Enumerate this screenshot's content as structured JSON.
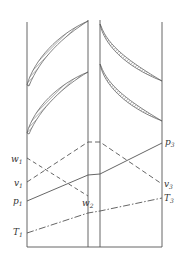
{
  "figure": {
    "colors": {
      "line": "#555555",
      "hatch": "#777777",
      "text": "#333333",
      "background": "#ffffff"
    },
    "cascades": {
      "nozzle": {
        "label": "stator blades",
        "count_visible": 2,
        "orientation": "curving up-right"
      },
      "rotor": {
        "label": "rotor blades",
        "count_visible": 2,
        "orientation": "curving down-right"
      }
    },
    "labels": {
      "w1": {
        "base": "w",
        "sub": "1"
      },
      "v1": {
        "base": "v",
        "sub": "1"
      },
      "p1": {
        "base": "p",
        "sub": "1"
      },
      "T1": {
        "base": "T",
        "sub": "1"
      },
      "w2": {
        "base": "w",
        "sub": "2"
      },
      "p3": {
        "base": "p",
        "sub": "3"
      },
      "v3": {
        "base": "v",
        "sub": "3"
      },
      "T3": {
        "base": "T",
        "sub": "3"
      }
    },
    "curves": [
      {
        "name": "v",
        "style": "dashed",
        "points": [
          [
            27,
            182
          ],
          [
            88,
            142
          ],
          [
            100,
            142
          ],
          [
            162,
            184
          ]
        ]
      },
      {
        "name": "w",
        "style": "dashed",
        "points": [
          [
            27,
            158
          ],
          [
            88,
            196
          ]
        ]
      },
      {
        "name": "p",
        "style": "solid",
        "points": [
          [
            27,
            201
          ],
          [
            88,
            175
          ],
          [
            100,
            174
          ],
          [
            162,
            143
          ]
        ]
      },
      {
        "name": "T",
        "style": "dash-dot",
        "points": [
          [
            27,
            233
          ],
          [
            88,
            213
          ],
          [
            100,
            211
          ],
          [
            162,
            198
          ]
        ]
      }
    ]
  }
}
